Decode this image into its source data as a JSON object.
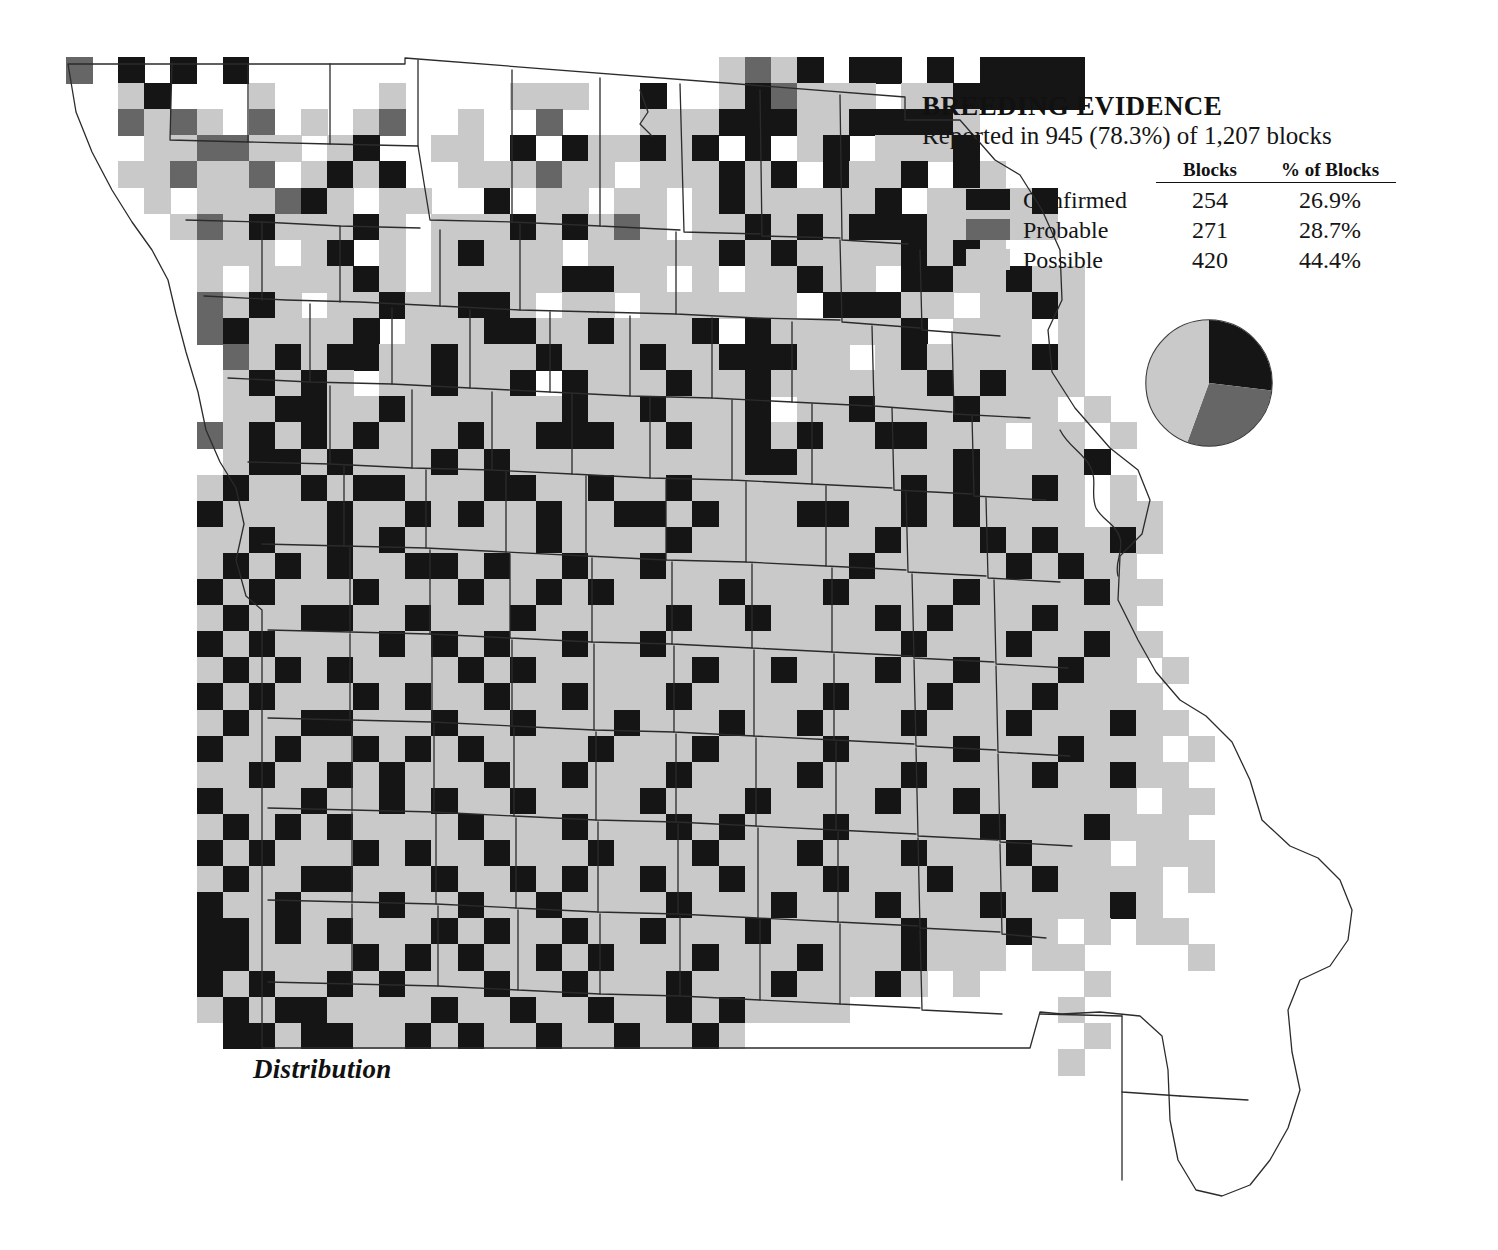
{
  "legend": {
    "title": "BREEDING EVIDENCE",
    "subtitle": "Reported in 945 (78.3%) of 1,207 blocks",
    "columns": {
      "category": "",
      "blocks": "Blocks",
      "percent": "% of Blocks"
    },
    "rows": [
      {
        "label": "Confirmed",
        "blocks": "254",
        "percent": "26.9%",
        "color": "#151515"
      },
      {
        "label": "Probable",
        "blocks": "271",
        "percent": "28.7%",
        "color": "#666666"
      },
      {
        "label": "Possible",
        "blocks": "420",
        "percent": "44.4%",
        "color": "#c9c9c9"
      }
    ]
  },
  "caption": "Distribution",
  "colors": {
    "confirmed": "#151515",
    "probable": "#666666",
    "possible": "#c9c9c9",
    "empty": "#ffffff",
    "outline": "#2b2b2b",
    "background": "#ffffff"
  },
  "chart_data": {
    "type": "pie",
    "title": "BREEDING EVIDENCE",
    "subtitle": "Reported in 945 (78.3%) of 1,207 blocks",
    "labels": [
      "Confirmed",
      "Probable",
      "Possible"
    ],
    "values": [
      254,
      271,
      420
    ],
    "percentages": [
      26.9,
      28.7,
      44.4
    ],
    "colors": [
      "#151515",
      "#666666",
      "#c9c9c9"
    ],
    "total_reported_blocks": 945,
    "total_reported_percent": 78.3,
    "total_blocks": 1207,
    "legend_position": "top-right",
    "start_angle_deg": 0,
    "direction": "clockwise"
  },
  "map": {
    "region": "Missouri",
    "grid": {
      "origin_x": 66,
      "origin_y": 57,
      "cell_w": 26.1,
      "cell_h": 26.1,
      "cols": 46,
      "rows": 39
    },
    "cell_codes": {
      "0": "empty",
      "1": "confirmed",
      "2": "probable",
      "3": "possible"
    },
    "rows": [
      "2010101000000000000000000323101101011110000000",
      "0031000300003000033300100312333033111110000000",
      "0023230203032003002000333111331111300000000000",
      "0003322330310033010133131010310333100000000000",
      "0033233203131003332330333131013310130000000000",
      "0003033321303300103303303133333103333100000000",
      "0000323133313033313132303313131113333300000000",
      "0000033303103031333033333131333313130000000000",
      "0000030333313033333113303033133011331330000000",
      "0000023130331331130330333333011133033130000000",
      "0000021333310333113313331013333310333030000000",
      "0000002313113313331333133111330313333130000000",
      "0000003131303313310133313313333331313330000000",
      "0000003311331333333133133310331333133303000000",
      "0000023131313331331113313313133113330330300000",
      "0000003113133313133333333311333333133331000000",
      "0000031331311333113313313333333313133130300000",
      "0000013333133131331331131333113313133330330000",
      "0000033133131333331333313333333133313133130000",
      "0000031313133113133133133333331333331313300000",
      "0000013133313331331313333133313333133331330000",
      "0000031331133133313333313313333131333133300000",
      "0000013133331313133133133333333313331331330000",
      "0000031313133331313333331331333133133313303000",
      "0000013133313133133133313333313331333133330000",
      "0000031331133313313331333133133313331333133000",
      "0000013313313131333313331333313333133313330300",
      "0000033133131333133133313333133313333133133000",
      "0000013331331313313333133313333133133333303300",
      "0000031313133331333133313133313333313331333000",
      "0000013133313133133313331333133313331333033300",
      "0000031331133313313133133133313331333133330300",
      "0000013313331331331333313331333133313333130000",
      "0000011313133313133133133313333313331303033000",
      "0000011333313131331313331333133313330330000300",
      "0000013133131333133133313331333130300003000000",
      "0000031311333313313313313133330000000030000000",
      "0000001131133131331331331300000000000003000000",
      "0000000000000000000000000000000000000030000000"
    ]
  }
}
